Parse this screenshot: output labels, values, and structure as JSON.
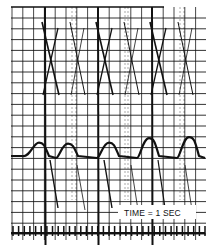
{
  "chart_data": {
    "type": "line",
    "title": "",
    "annotation": "TIME = 1 SEC",
    "grid": true,
    "grid_color": "#111111",
    "trace_color": "#111111",
    "background_color": "#ffffff",
    "time_marker": {
      "label": "TIME = 1 SEC",
      "tick_count": 35
    },
    "spikes": {
      "name": "heavy vertical traces",
      "beats": [
        1,
        3,
        5
      ]
    },
    "crossing_traces": {
      "name": "X-shaped crossing traces",
      "count": 6
    },
    "pulse_wave": {
      "name": "pulse waveform",
      "peaks": [
        {
          "beat": 1,
          "relative_height": 0.7
        },
        {
          "beat": 2,
          "relative_height": 0.65
        },
        {
          "beat": 3,
          "relative_height": 0.7
        },
        {
          "beat": 4,
          "relative_height": 0.9
        },
        {
          "beat": 5,
          "relative_height": 0.95
        }
      ]
    }
  }
}
